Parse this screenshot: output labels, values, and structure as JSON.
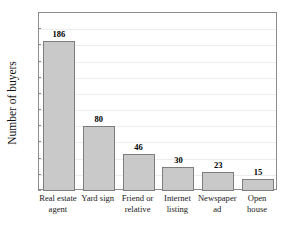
{
  "chart_data": {
    "type": "bar",
    "title": "",
    "xlabel": "",
    "ylabel": "Number of buyers",
    "ylim": [
      0,
      220
    ],
    "ytick_step": 20,
    "grid": true,
    "legend": "none",
    "categories": [
      "Real estate agent",
      "Yard sign",
      "Friend or relative",
      "Internet listing",
      "Newspaper ad",
      "Open house"
    ],
    "values": [
      186,
      80,
      46,
      30,
      23,
      15
    ],
    "value_labels": [
      "186",
      "80",
      "46",
      "30",
      "23",
      "15"
    ],
    "ytick_labels": [
      "0",
      "20",
      "40",
      "60",
      "80",
      "100",
      "120",
      "140",
      "160",
      "180",
      "200",
      "220"
    ],
    "bar_color": "#c9c9c9",
    "bar_border_color": "#7d7d7d",
    "axis_color": "#8c8c8c",
    "grid_color": "#ededed"
  },
  "title_remnant": "",
  "categories_display": [
    {
      "line1": "Real estate",
      "line2": "agent"
    },
    {
      "line1": "Yard sign",
      "line2": ""
    },
    {
      "line1": "Friend or",
      "line2": "relative"
    },
    {
      "line1": "Internet",
      "line2": "listing"
    },
    {
      "line1": "Newspaper",
      "line2": "ad"
    },
    {
      "line1": "Open",
      "line2": "house"
    }
  ]
}
